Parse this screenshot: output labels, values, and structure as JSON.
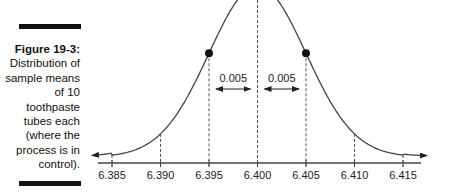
{
  "caption": {
    "figure_label": "Figure 19-3:",
    "text": "Distribution of sample means of 10 toothpaste tubes each (where the process is in control)."
  },
  "chart_data": {
    "type": "diagram-normal-curve",
    "title": "Distribution of sample means of 10 toothpaste tubes each (where the process is in control).",
    "mean": 6.4,
    "std_error": 0.005,
    "x_ticks": [
      6.385,
      6.39,
      6.395,
      6.4,
      6.405,
      6.41,
      6.415
    ],
    "x_tick_labels": [
      "6.385",
      "6.390",
      "6.395",
      "6.400",
      "6.405",
      "6.410",
      "6.415"
    ],
    "annotations": [
      {
        "label": "0.005",
        "from": 6.395,
        "to": 6.4,
        "type": "double-arrow"
      },
      {
        "label": "0.005",
        "from": 6.4,
        "to": 6.405,
        "type": "double-arrow"
      }
    ],
    "marked_points": [
      6.395,
      6.405
    ],
    "dashed_verticals": [
      6.385,
      6.39,
      6.395,
      6.4,
      6.405,
      6.41,
      6.415
    ],
    "xlabel": "",
    "ylabel": "",
    "grid": false
  },
  "colors": {
    "ink": "#222222",
    "curve": "#444444"
  }
}
